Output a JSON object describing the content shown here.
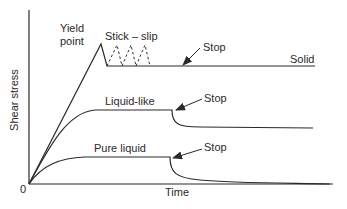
{
  "figure": {
    "title": "",
    "axes": {
      "ylabel": "Shear stress",
      "xlabel": "Time",
      "origin_label": "0"
    },
    "labels": {
      "yield_point": [
        "Yield",
        "point"
      ],
      "stick_slip": "Stick – slip",
      "solid": "Solid",
      "liquid_like": "Liquid-like",
      "pure_liquid": "Pure liquid",
      "stop_solid": "Stop",
      "stop_liquid_like": "Stop",
      "stop_pure_liquid": "Stop"
    },
    "curves": [
      {
        "name": "Solid",
        "description": "linear rise to yield point peak, sharp drop, stick-slip oscillations (dashed), then constant plateau after stop"
      },
      {
        "name": "Liquid-like",
        "description": "rises and saturates at intermediate plateau; after stop decays to a lower nonzero residual plateau"
      },
      {
        "name": "Pure liquid",
        "description": "rises and saturates at low plateau; after stop relaxes to zero"
      }
    ],
    "colors": {
      "line": "#2a2a2a",
      "background": "#ffffff"
    }
  }
}
